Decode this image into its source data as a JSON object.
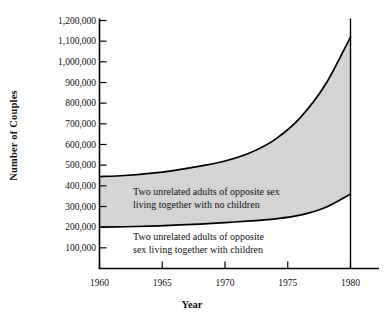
{
  "chart_data": {
    "type": "area",
    "title": "",
    "xlabel": "Year",
    "ylabel": "Number of Couples",
    "xlim": [
      1960,
      1980
    ],
    "ylim": [
      0,
      1200000
    ],
    "grid": false,
    "legend_position": "inline-annotations",
    "x_tick_labels": [
      "1960",
      "1965",
      "1970",
      "1975",
      "1980"
    ],
    "x_ticks": [
      1960,
      1965,
      1970,
      1975,
      1980
    ],
    "y_tick_labels": [
      "1,200,000",
      "1,100,000",
      "1,000,000",
      "900,000",
      "800,000",
      "700,000",
      "600,000",
      "500,000",
      "400,000",
      "300,000",
      "200,000",
      "100,000"
    ],
    "y_ticks": [
      1200000,
      1100000,
      1000000,
      900000,
      800000,
      700000,
      600000,
      500000,
      400000,
      300000,
      200000,
      100000
    ],
    "x": [
      1960,
      1962,
      1964,
      1966,
      1968,
      1970,
      1972,
      1974,
      1976,
      1978,
      1980
    ],
    "series": [
      {
        "name": "Two unrelated adults of opposite sex living together with no children",
        "values": [
          445000,
          450000,
          460000,
          475000,
          495000,
          520000,
          560000,
          625000,
          730000,
          890000,
          1120000
        ],
        "fill_color": "#d4d4d4",
        "line_color": "#000000"
      },
      {
        "name": "Two unrelated adults of opposite sex living together with children",
        "values": [
          200000,
          202000,
          205000,
          210000,
          215000,
          222000,
          230000,
          240000,
          258000,
          295000,
          360000
        ],
        "fill_color": "#ffffff",
        "line_color": "#000000"
      }
    ],
    "annotations": [
      {
        "id": "upper",
        "text": "Two unrelated adults of opposite sex\nliving together with no children"
      },
      {
        "id": "lower",
        "text": "Two unrelated adults of opposite\nsex living together with children"
      }
    ],
    "colors": {
      "band_fill": "#d4d4d4",
      "curve": "#000000",
      "axis": "#000000",
      "background": "#ffffff",
      "text": "#111111"
    }
  }
}
